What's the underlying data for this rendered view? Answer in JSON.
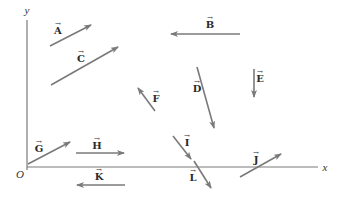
{
  "colors": {
    "arrow": "#7a7a7a",
    "axis": "#7a7a7a",
    "label": "#2a2a2a",
    "background": "#ffffff"
  },
  "axes": {
    "x_label": "x",
    "y_label": "y",
    "origin_label": "O",
    "origin": [
      27,
      167
    ],
    "x_end": 318,
    "y_end": 20
  },
  "vectors": [
    {
      "name": "A",
      "arrow_symbol": "→",
      "from": [
        50,
        46
      ],
      "to": [
        91,
        25
      ],
      "label_pos": [
        58,
        31
      ]
    },
    {
      "name": "B",
      "arrow_symbol": "→",
      "from": [
        240,
        34
      ],
      "to": [
        171,
        34
      ],
      "label_pos": [
        210,
        25
      ]
    },
    {
      "name": "C",
      "arrow_symbol": "→",
      "from": [
        51,
        85
      ],
      "to": [
        118,
        47
      ],
      "label_pos": [
        81,
        59
      ]
    },
    {
      "name": "D",
      "arrow_symbol": "→",
      "from": [
        197,
        67
      ],
      "to": [
        214,
        128
      ],
      "label_pos": [
        197,
        89
      ]
    },
    {
      "name": "E",
      "arrow_symbol": "→",
      "from": [
        254,
        69
      ],
      "to": [
        254,
        97
      ],
      "label_pos": [
        260,
        79
      ]
    },
    {
      "name": "F",
      "arrow_symbol": "→",
      "from": [
        155,
        111
      ],
      "to": [
        138,
        88
      ],
      "label_pos": [
        156,
        99
      ]
    },
    {
      "name": "G",
      "arrow_symbol": "→",
      "from": [
        28,
        164
      ],
      "to": [
        70,
        142
      ],
      "label_pos": [
        39,
        149
      ]
    },
    {
      "name": "H",
      "arrow_symbol": "→",
      "from": [
        76,
        153
      ],
      "to": [
        124,
        153
      ],
      "label_pos": [
        97,
        146
      ]
    },
    {
      "name": "I",
      "arrow_symbol": "→",
      "from": [
        173,
        136
      ],
      "to": [
        191,
        159
      ],
      "label_pos": [
        187,
        143
      ]
    },
    {
      "name": "J",
      "arrow_symbol": "→",
      "from": [
        240,
        177
      ],
      "to": [
        281,
        154
      ],
      "label_pos": [
        256,
        160
      ]
    },
    {
      "name": "K",
      "arrow_symbol": "→",
      "from": [
        125,
        185
      ],
      "to": [
        77,
        185
      ],
      "label_pos": [
        99,
        177
      ]
    },
    {
      "name": "L",
      "arrow_symbol": "→",
      "from": [
        194,
        161
      ],
      "to": [
        211,
        188
      ],
      "label_pos": [
        193,
        178
      ]
    }
  ]
}
